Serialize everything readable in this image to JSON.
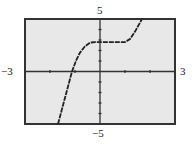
{
  "chart_data": {
    "type": "line",
    "title": "",
    "xlabel": "",
    "ylabel": "",
    "xlim": [
      -3,
      3
    ],
    "ylim": [
      -5,
      5
    ],
    "grid": false,
    "x_tick_step": 1,
    "y_tick_step": 1,
    "window_labels": {
      "xmin": "−3",
      "xmax": "3",
      "ymin": "−5",
      "ymax": "5"
    },
    "series": [
      {
        "name": "f(x)",
        "x": [
          -1.68,
          -1.4,
          -1.12,
          -0.95,
          -0.8,
          -0.6,
          -0.4,
          -0.2,
          0,
          0.5,
          1.0,
          1.2,
          1.4,
          1.68
        ],
        "y": [
          -5,
          -2.5,
          0,
          1.1,
          1.8,
          2.4,
          2.75,
          2.8,
          2.8,
          2.8,
          2.8,
          3.1,
          3.8,
          5
        ]
      }
    ]
  },
  "colors": {
    "background": "#e8e8e8",
    "frame": "#333333",
    "curve": "#222222",
    "axes": "#333333"
  }
}
